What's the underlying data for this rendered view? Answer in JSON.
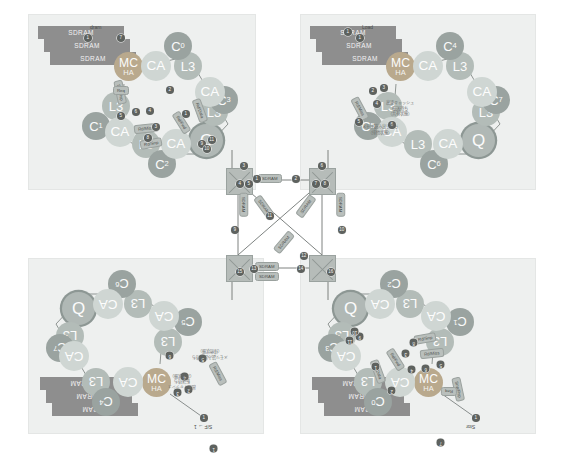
{
  "figure": {
    "background": "#ffffff",
    "panel_bg": "#eef0ef"
  },
  "palette": {
    "core": "#9aa3a0",
    "cache_agent": "#cfd6d3",
    "l3": "#b3bcb8",
    "memory_controller": "#b9a98d",
    "router": "#b0b8b5",
    "sdram": "#8e8e8e",
    "crossbar": "#b6bcb9",
    "badge": "#5e625f",
    "pill": "#b9bfbc"
  },
  "labels": {
    "sdram": "SDRAM",
    "cache_agent": "CA",
    "l3": "L3",
    "router": "Q",
    "mc_line1": "MC",
    "mc_line2": "HA",
    "load": "Load",
    "store": "Stor",
    "sf_to_1": "S/F → 1",
    "sdram_arrow": "dram"
  },
  "quadrants": [
    {
      "id": "top-left",
      "name": "quadrant-top-left",
      "rotated": false,
      "x": 28,
      "y": 14,
      "width": 228,
      "height": 176,
      "cores": [
        "C0",
        "C1",
        "C2",
        "C3"
      ],
      "has_sdram": true,
      "has_mc": true,
      "router": "Q",
      "entry_label": "dram"
    },
    {
      "id": "top-right",
      "name": "quadrant-top-right",
      "rotated": false,
      "x": 300,
      "y": 14,
      "width": 236,
      "height": 176,
      "cores": [
        "C4",
        "C5",
        "C6",
        "C7"
      ],
      "has_sdram": true,
      "has_mc": true,
      "router": "Q",
      "entry_label": "Load"
    },
    {
      "id": "bottom-left",
      "name": "quadrant-bottom-left",
      "rotated": true,
      "x": 28,
      "y": 258,
      "width": 236,
      "height": 176,
      "cores": [
        "C4",
        "C5",
        "C6",
        "C7"
      ],
      "has_sdram": true,
      "has_mc": true,
      "router": "Q",
      "entry_label": "S/F → 1"
    },
    {
      "id": "bottom-right",
      "name": "quadrant-bottom-right",
      "rotated": true,
      "x": 300,
      "y": 258,
      "width": 236,
      "height": 176,
      "cores": [
        "C0",
        "C1",
        "C2",
        "C3"
      ],
      "has_sdram": true,
      "has_mc": true,
      "router": "Q",
      "entry_label": "Stor"
    }
  ],
  "cores_top_left": [
    {
      "label": "C",
      "sub": "0",
      "x": 162,
      "y": 22,
      "size": 30
    },
    {
      "label": "C",
      "sub": "3",
      "x": 216,
      "y": 92,
      "size": 28
    },
    {
      "label": "C",
      "sub": "2",
      "x": 152,
      "y": 160,
      "size": 28
    },
    {
      "label": "C",
      "sub": "1",
      "x": 81,
      "y": 110,
      "size": 28
    }
  ],
  "cores_top_right": [
    {
      "label": "C",
      "sub": "4",
      "x": 372,
      "y": 22,
      "size": 30
    },
    {
      "label": "C",
      "sub": "7",
      "x": 478,
      "y": 108,
      "size": 27
    },
    {
      "label": "C",
      "sub": "6",
      "x": 398,
      "y": 162,
      "size": 27
    },
    {
      "label": "C",
      "sub": "5",
      "x": 311,
      "y": 88,
      "size": 27
    }
  ],
  "crossbars": [
    {
      "name": "crossbar-top-left",
      "x": 226,
      "y": 168,
      "size": 25
    },
    {
      "name": "crossbar-top-right",
      "x": 309,
      "y": 168,
      "size": 25
    },
    {
      "name": "crossbar-bottom-left",
      "x": 226,
      "y": 255,
      "size": 25
    },
    {
      "name": "crossbar-bottom-right",
      "x": 309,
      "y": 255,
      "size": 25
    }
  ],
  "center_pills": [
    {
      "name": "center-pill-top",
      "text": "SDRAM",
      "x": 258,
      "y": 174
    },
    {
      "name": "center-pill-bottom-upper",
      "text": "SDRAM",
      "x": 255,
      "y": 262
    },
    {
      "name": "center-pill-bottom-lower",
      "text": "SDRAM",
      "x": 255,
      "y": 272
    },
    {
      "name": "center-pill-left-vert",
      "text": "SDRAM",
      "x": 232,
      "y": 200
    },
    {
      "name": "center-pill-right-vert",
      "text": "SDRAM",
      "x": 329,
      "y": 200
    },
    {
      "name": "center-pill-diag-a",
      "text": "SDRAM",
      "x": 252,
      "y": 202
    },
    {
      "name": "center-pill-diag-b",
      "text": "SDRAM",
      "x": 294,
      "y": 202
    },
    {
      "name": "center-pill-diag-c",
      "text": "SDRAM",
      "x": 272,
      "y": 238
    }
  ],
  "center_badges": [
    {
      "n": "1",
      "x": 253,
      "y": 175
    },
    {
      "n": "2",
      "x": 292,
      "y": 175
    },
    {
      "n": "3",
      "x": 240,
      "y": 162
    },
    {
      "n": "4",
      "x": 236,
      "y": 180
    },
    {
      "n": "5",
      "x": 245,
      "y": 180
    },
    {
      "n": "6",
      "x": 318,
      "y": 162
    },
    {
      "n": "7",
      "x": 312,
      "y": 180
    },
    {
      "n": "8",
      "x": 321,
      "y": 180
    },
    {
      "n": "9",
      "x": 231,
      "y": 226
    },
    {
      "n": "10",
      "x": 338,
      "y": 226
    },
    {
      "n": "11",
      "x": 266,
      "y": 212
    },
    {
      "n": "12",
      "x": 300,
      "y": 252
    },
    {
      "n": "13",
      "x": 250,
      "y": 265
    },
    {
      "n": "14",
      "x": 297,
      "y": 265
    },
    {
      "n": "15",
      "x": 236,
      "y": 268
    },
    {
      "n": "16",
      "x": 327,
      "y": 268
    }
  ],
  "tl_badges": [
    {
      "n": "7",
      "x": 117,
      "y": 34
    },
    {
      "n": "6",
      "x": 132,
      "y": 108
    },
    {
      "n": "5",
      "x": 117,
      "y": 112
    },
    {
      "n": "4",
      "x": 146,
      "y": 107
    },
    {
      "n": "3",
      "x": 152,
      "y": 123
    },
    {
      "n": "2",
      "x": 166,
      "y": 86
    },
    {
      "n": "1",
      "x": 182,
      "y": 110
    },
    {
      "n": "8",
      "x": 144,
      "y": 134
    },
    {
      "n": "9",
      "x": 198,
      "y": 140
    },
    {
      "n": "10",
      "x": 203,
      "y": 145
    },
    {
      "n": "11",
      "x": 208,
      "y": 136
    }
  ],
  "tr_badges": [
    {
      "n": "1",
      "x": 344,
      "y": 28
    },
    {
      "n": "2",
      "x": 369,
      "y": 87
    },
    {
      "n": "3",
      "x": 380,
      "y": 84
    },
    {
      "n": "4",
      "x": 373,
      "y": 100
    },
    {
      "n": "5",
      "x": 355,
      "y": 118
    },
    {
      "n": "6",
      "x": 388,
      "y": 121
    }
  ],
  "tl_pills": [
    {
      "text": "Rd/Miss",
      "x": 134,
      "y": 124,
      "rot": -6
    },
    {
      "text": "Rd/Snp",
      "x": 140,
      "y": 139,
      "rot": -10
    },
    {
      "text": "Rd/Fwd",
      "x": 170,
      "y": 118,
      "rot": 58
    },
    {
      "text": "Rd/Data",
      "x": 188,
      "y": 106,
      "rot": 70
    },
    {
      "text": "Snp/Rsp",
      "x": 108,
      "y": 88,
      "rot": 78
    },
    {
      "text": "Req",
      "x": 113,
      "y": 86,
      "rot": 0
    }
  ],
  "tr_pills": [
    {
      "text": "Rd/Miss",
      "x": 348,
      "y": 104,
      "rot": 62
    }
  ],
  "tr_annotations": [
    {
      "text": "高速キャッシュ\n転送待ち\n（共有状態）",
      "x": 386,
      "y": 100
    },
    {
      "text": "メモリ読み出し待ち\n（排他状態）",
      "x": 362,
      "y": 124
    }
  ]
}
